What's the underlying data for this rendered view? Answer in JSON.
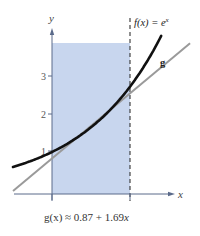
{
  "chart_data": {
    "type": "line",
    "title": "",
    "xlabel": "x",
    "ylabel": "y",
    "xlim": [
      -0.5,
      1.55
    ],
    "ylim": [
      0,
      4
    ],
    "y_ticks": [
      1,
      2,
      3
    ],
    "x_ticks": [
      0,
      1
    ],
    "grid": false,
    "shaded_region": {
      "x": [
        0,
        1
      ],
      "y": [
        0,
        3.8
      ],
      "color": "#c8d6ee"
    },
    "vertical_dashed_line": {
      "x": 1
    },
    "series": [
      {
        "name": "f(x) = e^x",
        "label": "f(x) = e^x",
        "color": "#111111",
        "function": "exp",
        "x": [
          -0.5,
          -0.25,
          0,
          0.25,
          0.5,
          0.75,
          1.0,
          1.25,
          1.4
        ],
        "values": [
          0.61,
          0.78,
          1.0,
          1.28,
          1.65,
          2.12,
          2.72,
          3.49,
          4.06
        ]
      },
      {
        "name": "g",
        "label": "g",
        "color": "#9a9a9a",
        "function": "linear",
        "intercept": 0.87,
        "slope": 1.69,
        "x": [
          -0.5,
          1.77
        ],
        "values": [
          0.025,
          3.86
        ]
      }
    ],
    "annotations": [
      "f(x) = e^x",
      "g",
      "g(x) ≈ 0.87 + 1.69x"
    ]
  },
  "labels": {
    "y_axis": "y",
    "x_axis": "x",
    "y_ticks": [
      "1",
      "2",
      "3"
    ],
    "f_label_main": "f(x) = e",
    "f_label_exp": "x",
    "g_label": "g",
    "equation_prefix": "g(x) ≈ 0.87 + 1.69",
    "equation_var": "x"
  },
  "colors": {
    "shade": "#c8d6ee",
    "axis": "#5a6a8a",
    "f_curve": "#111111",
    "g_line": "#9a9a9a",
    "dashed": "#333333"
  }
}
